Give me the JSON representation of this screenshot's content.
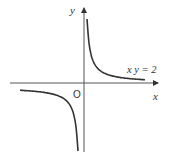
{
  "diagram": {
    "axes": {
      "x_label": "x",
      "y_label": "y",
      "origin_label": "O"
    },
    "curve": {
      "equation_label": "x y = 2",
      "k": 2,
      "color": "#333333"
    }
  },
  "chart_data": {
    "type": "line",
    "title": "",
    "xlabel": "x",
    "ylabel": "y",
    "series": [
      {
        "name": "xy = 2 (first quadrant branch)",
        "x": [
          0.1,
          0.2,
          0.5,
          1,
          2,
          4,
          10
        ],
        "y": [
          20,
          10,
          4,
          2,
          1,
          0.5,
          0.2
        ]
      },
      {
        "name": "xy = 2 (third quadrant branch)",
        "x": [
          -10,
          -4,
          -2,
          -1,
          -0.5,
          -0.2,
          -0.1
        ],
        "y": [
          -0.2,
          -0.5,
          -1,
          -2,
          -4,
          -10,
          -20
        ]
      }
    ],
    "annotations": [
      "x y = 2",
      "O"
    ],
    "grid": false
  }
}
